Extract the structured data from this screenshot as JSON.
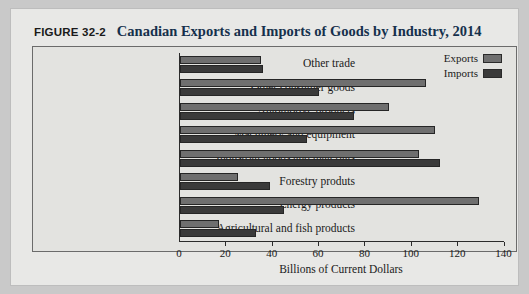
{
  "figure": {
    "label": "FIGURE 32-2",
    "title": "Canadian Exports and Imports of Goods by Industry, 2014"
  },
  "legend": {
    "items": [
      {
        "name": "Exports",
        "color": "#6f6f6f"
      },
      {
        "name": "Imports",
        "color": "#3a3a3a"
      }
    ]
  },
  "axis": {
    "x_title": "Billions of Current Dollars",
    "ticks": [
      "0",
      "20",
      "40",
      "60",
      "80",
      "100",
      "120",
      "140"
    ]
  },
  "chart_data": {
    "type": "bar",
    "orientation": "horizontal",
    "title": "Canadian Exports and Imports of Goods by Industry, 2014",
    "xlabel": "Billions of Current Dollars",
    "ylabel": "",
    "xlim": [
      0,
      140
    ],
    "xticks": [
      0,
      20,
      40,
      60,
      80,
      100,
      120,
      140
    ],
    "grid": false,
    "legend_position": "top-right",
    "categories": [
      "Other trade",
      "Other consumer goods",
      "Automotive products",
      "Machinery and equipment",
      "Industrial goods and materials",
      "Forestry produts",
      "Energy products",
      "Agricultural and fish products"
    ],
    "series": [
      {
        "name": "Exports",
        "color": "#6f6f6f",
        "values": [
          35,
          106,
          90,
          110,
          103,
          25,
          129,
          17
        ]
      },
      {
        "name": "Imports",
        "color": "#3a3a3a",
        "values": [
          36,
          60,
          75,
          55,
          112,
          39,
          45,
          33
        ]
      }
    ]
  }
}
